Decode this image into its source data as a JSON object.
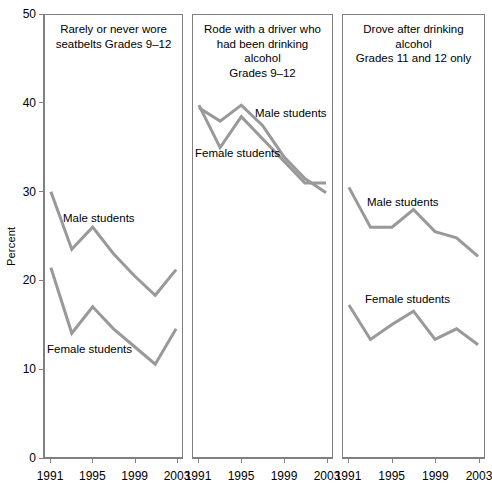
{
  "axis": {
    "ylabel": "Percent",
    "yticks": [
      0,
      10,
      20,
      30,
      40,
      50
    ],
    "ylim": [
      0,
      50
    ],
    "xticks": [
      "1991",
      "1995",
      "1999",
      "2003"
    ],
    "xlim": [
      1991,
      2003
    ]
  },
  "style": {
    "line_color": "#999999",
    "panel_border_color": "#808080",
    "axis_color": "#808080",
    "text_color": "#000000",
    "background": "#ffffff",
    "line_width": 3
  },
  "chart_data": {
    "type": "line",
    "title": "",
    "xlabel": "",
    "ylabel": "Percent",
    "ylim": [
      0,
      50
    ],
    "yticks": [
      0,
      10,
      20,
      30,
      40,
      50
    ],
    "xticks": [
      1991,
      1995,
      1999,
      2003
    ],
    "x": [
      1991,
      1993,
      1995,
      1997,
      1999,
      2001,
      2003
    ],
    "grid": false,
    "legend_position": "inline-annotation",
    "panels": [
      {
        "id": "panel-seatbelts",
        "title": "Rarely or never wore\nseatbelts Grades 9–12",
        "series": [
          {
            "name": "Male students",
            "label": "Male students",
            "values": [
              30.0,
              23.5,
              26.0,
              23.0,
              20.5,
              18.3,
              21.2
            ]
          },
          {
            "name": "Female students",
            "label": "Female students",
            "values": [
              21.4,
              14.0,
              17.0,
              14.5,
              12.5,
              10.5,
              14.5
            ]
          }
        ]
      },
      {
        "id": "panel-rode-with-drinking-driver",
        "title": "Rode with a driver who\nhad been drinking alcohol\nGrades 9–12",
        "series": [
          {
            "name": "Male students",
            "label": "Male students",
            "values": [
              39.5,
              38.0,
              39.8,
              37.5,
              34.0,
              31.5,
              29.9
            ]
          },
          {
            "name": "Female students",
            "label": "Female students",
            "values": [
              39.8,
              35.0,
              38.5,
              36.0,
              33.5,
              31.0,
              31.0
            ]
          }
        ]
      },
      {
        "id": "panel-drove-after-drinking",
        "title": "Drove after drinking\nalcohol\nGrades 11 and 12 only",
        "series": [
          {
            "name": "Male students",
            "label": "Male students",
            "values": [
              30.5,
              26.0,
              26.0,
              28.0,
              25.5,
              24.8,
              22.7
            ]
          },
          {
            "name": "Female students",
            "label": "Female students",
            "values": [
              17.2,
              13.3,
              15.0,
              16.5,
              13.3,
              14.5,
              12.7
            ]
          }
        ]
      }
    ]
  }
}
